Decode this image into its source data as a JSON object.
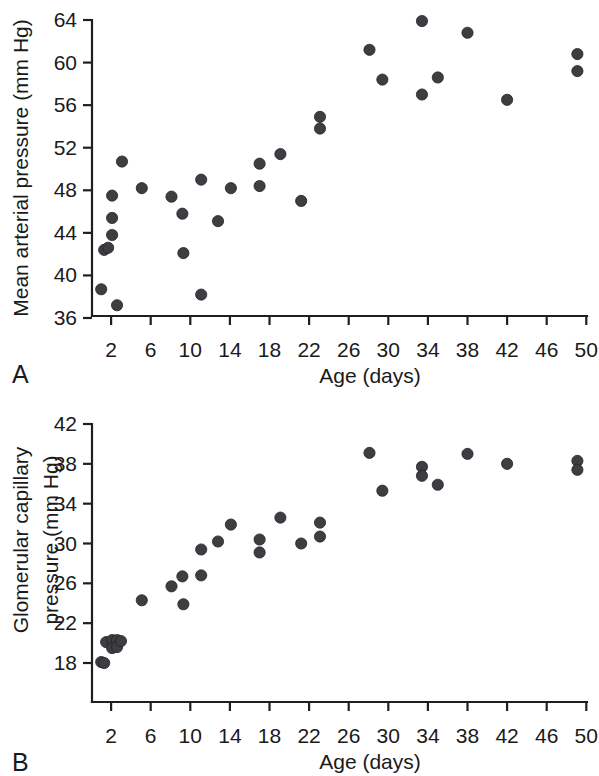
{
  "figure": {
    "panels": [
      {
        "letter": "A",
        "xlabel": "Age (days)",
        "ylabel": "Mean arterial pressure (mm Hg)",
        "ylabel_lines": [
          "Mean arterial pressure (mm Hg)"
        ]
      },
      {
        "letter": "B",
        "xlabel": "Age (days)",
        "ylabel": "Glomerular capillary pressure (mm Hg)",
        "ylabel_lines": [
          "Glomerular capillary",
          "pressure (mm Hg)"
        ]
      }
    ],
    "marker_color": "#3d3d42",
    "axis_color": "#1f1f1f"
  },
  "chart_data": [
    {
      "type": "scatter",
      "panel": "A",
      "title": "",
      "xlabel": "Age (days)",
      "ylabel": "Mean arterial pressure (mm Hg)",
      "xlim": [
        0,
        50.5
      ],
      "ylim": [
        36,
        64
      ],
      "xticks": [
        2,
        6,
        10,
        14,
        18,
        22,
        26,
        30,
        34,
        38,
        42,
        46,
        50
      ],
      "xticklabels": [
        "2",
        "6",
        "10",
        "14",
        "18",
        "22",
        "26",
        "30",
        "34",
        "38",
        "42",
        "46",
        "50"
      ],
      "yticks": [
        36,
        40,
        44,
        48,
        52,
        56,
        60,
        64
      ],
      "yticklabels": [
        "36",
        "40",
        "44",
        "48",
        "52",
        "56",
        "60",
        "64"
      ],
      "grid": false,
      "legend": null,
      "points": [
        {
          "x": 1.0,
          "y": 38.7
        },
        {
          "x": 1.3,
          "y": 42.4
        },
        {
          "x": 1.7,
          "y": 42.6
        },
        {
          "x": 2.1,
          "y": 43.8
        },
        {
          "x": 2.1,
          "y": 45.4
        },
        {
          "x": 2.1,
          "y": 47.5
        },
        {
          "x": 2.6,
          "y": 37.2
        },
        {
          "x": 3.1,
          "y": 50.7
        },
        {
          "x": 5.1,
          "y": 48.2
        },
        {
          "x": 8.1,
          "y": 47.4
        },
        {
          "x": 9.2,
          "y": 45.8
        },
        {
          "x": 9.3,
          "y": 42.1
        },
        {
          "x": 11.1,
          "y": 49.0
        },
        {
          "x": 11.1,
          "y": 38.2
        },
        {
          "x": 12.8,
          "y": 45.1
        },
        {
          "x": 14.1,
          "y": 48.2
        },
        {
          "x": 17.0,
          "y": 48.4
        },
        {
          "x": 17.0,
          "y": 50.5
        },
        {
          "x": 19.1,
          "y": 51.4
        },
        {
          "x": 21.2,
          "y": 47.0
        },
        {
          "x": 23.1,
          "y": 54.9
        },
        {
          "x": 23.1,
          "y": 53.8
        },
        {
          "x": 28.1,
          "y": 61.2
        },
        {
          "x": 29.4,
          "y": 58.4
        },
        {
          "x": 33.4,
          "y": 63.9
        },
        {
          "x": 33.4,
          "y": 57.0
        },
        {
          "x": 35.0,
          "y": 58.6
        },
        {
          "x": 38.0,
          "y": 62.8
        },
        {
          "x": 42.0,
          "y": 56.5
        },
        {
          "x": 49.1,
          "y": 60.8
        },
        {
          "x": 49.1,
          "y": 59.2
        }
      ]
    },
    {
      "type": "scatter",
      "panel": "B",
      "title": "",
      "xlabel": "Age (days)",
      "ylabel": "Glomerular capillary pressure (mm Hg)",
      "xlim": [
        0,
        50.5
      ],
      "ylim": [
        16.4,
        42
      ],
      "xticks": [
        2,
        6,
        10,
        14,
        18,
        22,
        26,
        30,
        34,
        38,
        42,
        46,
        50
      ],
      "xticklabels": [
        "2",
        "6",
        "10",
        "14",
        "18",
        "22",
        "26",
        "30",
        "34",
        "38",
        "42",
        "46",
        "50"
      ],
      "yticks": [
        18,
        22,
        26,
        30,
        34,
        38,
        42
      ],
      "yticklabels": [
        "18",
        "22",
        "26",
        "30",
        "34",
        "38",
        "42"
      ],
      "grid": false,
      "legend": null,
      "points": [
        {
          "x": 1.0,
          "y": 18.1
        },
        {
          "x": 1.3,
          "y": 18.0
        },
        {
          "x": 1.5,
          "y": 20.1
        },
        {
          "x": 2.1,
          "y": 20.3
        },
        {
          "x": 2.1,
          "y": 19.5
        },
        {
          "x": 2.6,
          "y": 20.3
        },
        {
          "x": 2.6,
          "y": 19.6
        },
        {
          "x": 3.0,
          "y": 20.2
        },
        {
          "x": 5.1,
          "y": 24.3
        },
        {
          "x": 8.1,
          "y": 25.7
        },
        {
          "x": 9.2,
          "y": 26.7
        },
        {
          "x": 9.3,
          "y": 23.9
        },
        {
          "x": 11.1,
          "y": 29.4
        },
        {
          "x": 11.1,
          "y": 26.8
        },
        {
          "x": 12.8,
          "y": 30.2
        },
        {
          "x": 14.1,
          "y": 31.9
        },
        {
          "x": 17.0,
          "y": 30.4
        },
        {
          "x": 17.0,
          "y": 29.1
        },
        {
          "x": 19.1,
          "y": 32.6
        },
        {
          "x": 21.2,
          "y": 30.0
        },
        {
          "x": 23.1,
          "y": 32.1
        },
        {
          "x": 23.1,
          "y": 30.7
        },
        {
          "x": 28.1,
          "y": 39.1
        },
        {
          "x": 29.4,
          "y": 35.3
        },
        {
          "x": 33.4,
          "y": 37.7
        },
        {
          "x": 33.4,
          "y": 36.8
        },
        {
          "x": 35.0,
          "y": 35.9
        },
        {
          "x": 38.0,
          "y": 39.0
        },
        {
          "x": 42.0,
          "y": 38.0
        },
        {
          "x": 49.1,
          "y": 38.3
        },
        {
          "x": 49.1,
          "y": 37.4
        }
      ]
    }
  ]
}
